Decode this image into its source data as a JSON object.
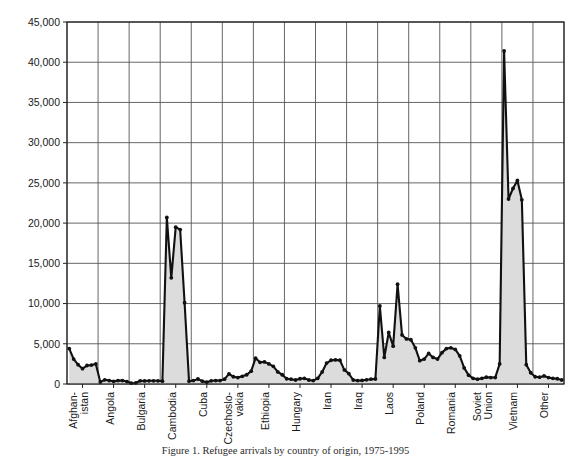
{
  "figure": {
    "caption": "Figure 1. Refugee arrivals by country of origin, 1975-1995",
    "background_color": "#ffffff",
    "line_color": "#111111",
    "fill_color": "#dcdcdc",
    "grid_color": "#555555",
    "axis_color": "#222222"
  },
  "chart_data": {
    "type": "line",
    "title": "",
    "subtitle": "",
    "xlabel": "",
    "ylabel": "",
    "ylim": [
      0,
      45000
    ],
    "ytick_values": [
      0,
      5000,
      10000,
      15000,
      20000,
      25000,
      30000,
      35000,
      40000,
      45000
    ],
    "ytick_labels": [
      "0",
      "5,000",
      "10,000",
      "15,000",
      "20,000",
      "25,000",
      "30,000",
      "35,000",
      "40,000",
      "45,000"
    ],
    "grid": true,
    "grid_axis": "both",
    "legend": "none",
    "area_filled": true,
    "markers": true,
    "categories": [
      "Afghan-\nistan",
      "Angola",
      "Bulgaria",
      "Cambodia",
      "Cuba",
      "Czechoslo-\nvakia",
      "Ethiopia",
      "Hungary",
      "Iran",
      "Iraq",
      "Laos",
      "Poland",
      "Romania",
      "Soviet\nUnion",
      "Vietnam",
      "Other"
    ],
    "category_labels_flat": [
      "Afghan-istan",
      "Angola",
      "Bulgaria",
      "Cambodia",
      "Cuba",
      "Czechoslo-vakia",
      "Ethiopia",
      "Hungary",
      "Iran",
      "Iraq",
      "Laos",
      "Poland",
      "Romania",
      "Soviet Union",
      "Vietnam",
      "Other"
    ],
    "series": [
      {
        "name": "Arrivals",
        "groups": [
          {
            "category": "Afghan-istan",
            "values": [
              4400,
              3100,
              2400,
              1900,
              2300,
              2350,
              2500
            ]
          },
          {
            "category": "Angola",
            "values": [
              250,
              520,
              430,
              330,
              420,
              430,
              300
            ]
          },
          {
            "category": "Bulgaria",
            "values": [
              100,
              130,
              400,
              380,
              400,
              400,
              400
            ]
          },
          {
            "category": "Cambodia",
            "values": [
              350,
              20700,
              13200,
              19500,
              19200,
              10100,
              350
            ]
          },
          {
            "category": "Cuba",
            "values": [
              420,
              620,
              350,
              230,
              400,
              420,
              430
            ]
          },
          {
            "category": "Czechoslo-vakia",
            "values": [
              600,
              1250,
              900,
              800,
              950,
              1150,
              1600
            ]
          },
          {
            "category": "Ethiopia",
            "values": [
              3200,
              2700,
              2750,
              2500,
              2200,
              1500,
              1150
            ]
          },
          {
            "category": "Hungary",
            "values": [
              650,
              600,
              500,
              650,
              700,
              500,
              420
            ]
          },
          {
            "category": "Iran",
            "values": [
              700,
              1500,
              2600,
              2950,
              3000,
              2950,
              1750
            ]
          },
          {
            "category": "Iraq",
            "values": [
              1300,
              500,
              420,
              450,
              520,
              600,
              620
            ]
          },
          {
            "category": "Laos",
            "values": [
              9700,
              3300,
              6400,
              4700,
              12400,
              6100,
              5600
            ]
          },
          {
            "category": "Poland",
            "values": [
              5500,
              4500,
              2900,
              3100,
              3800,
              3300,
              3100
            ]
          },
          {
            "category": "Romania",
            "values": [
              3900,
              4400,
              4500,
              4300,
              3500,
              2000,
              1100
            ]
          },
          {
            "category": "Soviet Union",
            "values": [
              700,
              600,
              700,
              850,
              800,
              800,
              2500
            ]
          },
          {
            "category": "Vietnam",
            "values": [
              41400,
              23000,
              24300,
              25300,
              22900,
              2400,
              1400
            ]
          },
          {
            "category": "Other",
            "values": [
              900,
              850,
              1000,
              800,
              700,
              650,
              500
            ]
          }
        ]
      }
    ],
    "annotations": [
      {
        "label": "Cambodia peak",
        "value": 20700
      },
      {
        "label": "Vietnam peak",
        "value": 41400
      },
      {
        "label": "Laos peak",
        "value": 12400
      }
    ]
  }
}
